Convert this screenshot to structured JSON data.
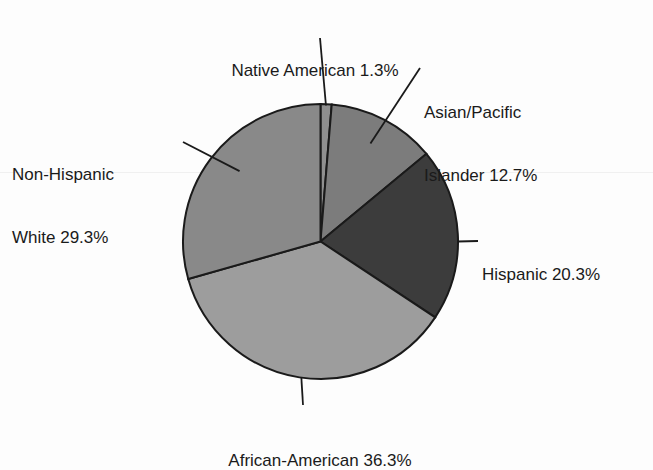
{
  "chart_data": {
    "type": "pie",
    "title": "",
    "subtitle": "",
    "xlabel": "",
    "ylabel": "",
    "legend_position": "none",
    "grid": false,
    "units": "percent",
    "start_angle_deg": 0,
    "direction": "clockwise",
    "categories": [
      "Native American",
      "Asian/Pacific Islander",
      "Hispanic",
      "African-American",
      "Non-Hispanic White"
    ],
    "values": [
      1.3,
      12.7,
      20.3,
      36.3,
      29.3
    ],
    "slices": [
      {
        "name": "Native American",
        "value": 1.3,
        "label": "Native American 1.3%",
        "label_lines": [
          "Native American 1.3%"
        ],
        "color": "#8f8f8f",
        "start_angle_deg": 0.0,
        "end_angle_deg": 4.68,
        "leader": "vertical"
      },
      {
        "name": "Asian/Pacific Islander",
        "value": 12.7,
        "label": "Asian/Pacific Islander 12.7%",
        "label_lines": [
          "Asian/Pacific",
          "Islander 12.7%"
        ],
        "color": "#7c7c7c",
        "start_angle_deg": 4.68,
        "end_angle_deg": 50.4,
        "leader": "diagonal"
      },
      {
        "name": "Hispanic",
        "value": 20.3,
        "label": "Hispanic 20.3%",
        "label_lines": [
          "Hispanic 20.3%"
        ],
        "color": "#3c3c3c",
        "start_angle_deg": 50.4,
        "end_angle_deg": 123.48,
        "leader": "horizontal"
      },
      {
        "name": "African-American",
        "value": 36.3,
        "label": "African-American 36.3%",
        "label_lines": [
          "African-American 36.3%"
        ],
        "color": "#9d9d9d",
        "start_angle_deg": 123.48,
        "end_angle_deg": 254.16,
        "leader": "vertical"
      },
      {
        "name": "Non-Hispanic White",
        "value": 29.3,
        "label": "Non-Hispanic White 29.3%",
        "label_lines": [
          "Non-Hispanic",
          "White 29.3%"
        ],
        "color": "#898989",
        "start_angle_deg": 254.16,
        "end_angle_deg": 360.0,
        "leader": "diagonal"
      }
    ],
    "colors": {
      "native_american": "#8f8f8f",
      "asian_pacific_islander": "#7c7c7c",
      "hispanic": "#3c3c3c",
      "african_american": "#9d9d9d",
      "non_hispanic_white": "#898989",
      "outline": "#1a1a1a",
      "background": "#fdfdfd",
      "text": "#1a1a1a"
    }
  },
  "labels": {
    "native_american": {
      "line1": "Native American 1.3%",
      "line2": ""
    },
    "asian_pacific_islander": {
      "line1": "Asian/Pacific",
      "line2": "Islander 12.7%"
    },
    "non_hispanic_white": {
      "line1": "Non-Hispanic",
      "line2": "White 29.3%"
    },
    "hispanic": {
      "line1": "Hispanic 20.3%",
      "line2": ""
    },
    "african_american": {
      "line1": "African-American 36.3%",
      "line2": ""
    }
  }
}
